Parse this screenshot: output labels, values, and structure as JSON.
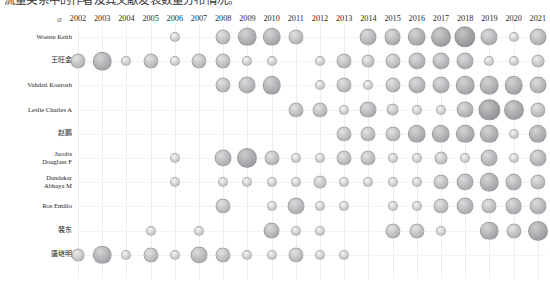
{
  "caption": {
    "text": "流量关系中的作者及其文献发表数量分布情况。"
  },
  "axis": {
    "origin_symbol": "⌀",
    "y_title": "",
    "x_title": ""
  },
  "chart_data": {
    "type": "heatmap",
    "subtype": "bubble-matrix",
    "title": "",
    "xlabel": "",
    "ylabel": "",
    "grid": true,
    "legend": "none",
    "value_encoding": "bubble-area",
    "value_range": [
      0,
      9
    ],
    "categories": [
      "2002",
      "2003",
      "2004",
      "2005",
      "2006",
      "2007",
      "2008",
      "2009",
      "2010",
      "2011",
      "2012",
      "2013",
      "2014",
      "2015",
      "2016",
      "2017",
      "2018",
      "2019",
      "2020",
      "2021"
    ],
    "rows": [
      "Woeste Keith",
      "王旺金",
      "Vahdati Kourosh",
      "Leslie Charles A",
      "赵鹏",
      "Jacobs\nDouglass F",
      "Dandekar\nAbhaya M",
      "Ros Emilio",
      "裴东",
      "唐继明"
    ],
    "series": [
      {
        "name": "Woeste Keith",
        "values": [
          0,
          0,
          0,
          0,
          1,
          0,
          3,
          5,
          5,
          3,
          0,
          0,
          4,
          4,
          5,
          6,
          7,
          4,
          1,
          4
        ]
      },
      {
        "name": "王旺金",
        "values": [
          3,
          5,
          1,
          3,
          1,
          3,
          3,
          1,
          1,
          0,
          1,
          3,
          2,
          3,
          4,
          4,
          4,
          1,
          1,
          2
        ]
      },
      {
        "name": "Vahdati Kourosh",
        "values": [
          0,
          0,
          0,
          0,
          0,
          0,
          3,
          4,
          5,
          0,
          1,
          3,
          1,
          3,
          4,
          4,
          5,
          5,
          5,
          4
        ]
      },
      {
        "name": "Leslie Charles A",
        "values": [
          0,
          0,
          0,
          0,
          0,
          0,
          0,
          0,
          0,
          3,
          3,
          1,
          4,
          2,
          1,
          1,
          4,
          7,
          6,
          3
        ]
      },
      {
        "name": "赵鹏",
        "values": [
          0,
          0,
          0,
          0,
          0,
          0,
          0,
          0,
          0,
          0,
          0,
          3,
          3,
          3,
          5,
          5,
          5,
          5,
          1,
          5
        ]
      },
      {
        "name": "Jacobs\nDouglass F",
        "values": [
          0,
          0,
          0,
          0,
          1,
          0,
          4,
          6,
          3,
          1,
          1,
          3,
          3,
          1,
          1,
          2,
          1,
          4,
          1,
          4
        ]
      },
      {
        "name": "Dandekar\nAbhaya M",
        "values": [
          0,
          0,
          0,
          0,
          1,
          0,
          1,
          1,
          1,
          1,
          2,
          1,
          1,
          1,
          1,
          3,
          4,
          5,
          4,
          3
        ]
      },
      {
        "name": "Ros Emilio",
        "values": [
          0,
          0,
          0,
          0,
          0,
          0,
          3,
          0,
          1,
          4,
          1,
          1,
          0,
          1,
          1,
          3,
          4,
          3,
          4,
          4
        ]
      },
      {
        "name": "裴东",
        "values": [
          0,
          0,
          0,
          1,
          0,
          1,
          0,
          0,
          4,
          1,
          1,
          0,
          0,
          3,
          3,
          1,
          0,
          5,
          3,
          6
        ]
      },
      {
        "name": "唐继明",
        "values": [
          2,
          5,
          1,
          3,
          1,
          4,
          3,
          1,
          1,
          3,
          1,
          1,
          0,
          0,
          0,
          0,
          0,
          0,
          0,
          0
        ]
      }
    ]
  }
}
